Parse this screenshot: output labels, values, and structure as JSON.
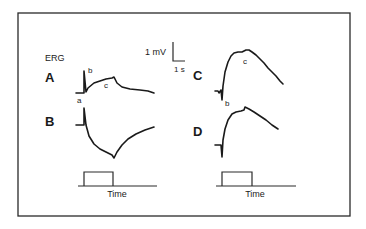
{
  "figure": {
    "title": "ERG",
    "scale_bar": {
      "voltage_label": "1 mV",
      "time_label": "1 s"
    },
    "panels": [
      {
        "id": "A",
        "label": "A",
        "components": [
          "a",
          "b",
          "c"
        ]
      },
      {
        "id": "B",
        "label": "B",
        "components": []
      },
      {
        "id": "C",
        "label": "C",
        "components": [
          "b",
          "c"
        ]
      },
      {
        "id": "D",
        "label": "D",
        "components": []
      }
    ],
    "component_labels": {
      "a": "a",
      "b": "b",
      "c": "c"
    },
    "stimulus": {
      "axis_label_left": "Time",
      "axis_label_right": "Time"
    }
  },
  "colors": {
    "line": "#1a1a1a",
    "frame": "#2a2a2a",
    "background": "#ffffff"
  }
}
